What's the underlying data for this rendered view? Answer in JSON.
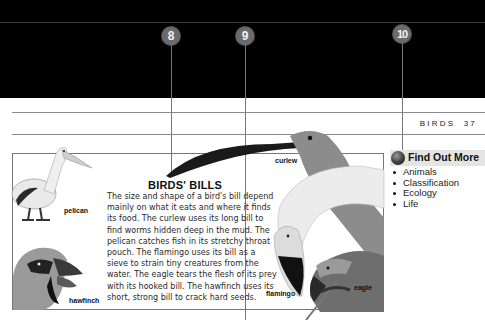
{
  "callouts": [
    {
      "number": "8",
      "x": 171
    },
    {
      "number": "9",
      "x": 245
    },
    {
      "number": "10",
      "x": 402
    }
  ],
  "running_head": {
    "section": "BIRDS",
    "page_number": "37"
  },
  "article": {
    "heading": "BIRDS' BILLS",
    "body": "The size and shape of a bird's bill depend mainly on what it eats and where it finds its food. The curlew uses its long bill to find worms hidden deep in the mud. The pelican catches fish in its stretchy throat pouch. The flamingo uses its bill as a sieve to strain tiny creatures from the water. The eagle tears the flesh of its prey with its hooked bill. The hawfinch uses its short, strong bill to crack hard seeds."
  },
  "birds": [
    {
      "name": "pelican"
    },
    {
      "name": "hawfinch"
    },
    {
      "name": "curlew"
    },
    {
      "name": "flamingo"
    },
    {
      "name": "eagle"
    }
  ],
  "find_out_more": {
    "title": "Find Out More",
    "links": [
      "Animals",
      "Classification",
      "Ecology",
      "Life"
    ]
  }
}
